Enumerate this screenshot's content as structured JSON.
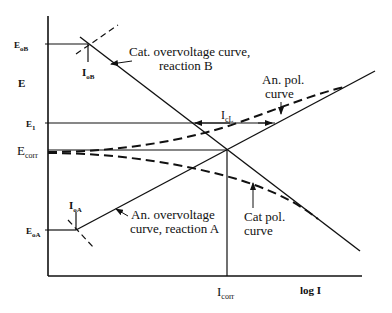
{
  "axes": {
    "y_label": "E",
    "x_label": "log I"
  },
  "potential_labels": {
    "e0b": {
      "main": "E",
      "sub": "oB"
    },
    "e1": {
      "main": "E",
      "sub": "1"
    },
    "ecorr": {
      "main": "E",
      "sub": "corr"
    },
    "e0a": {
      "main": "E",
      "sub": "oA"
    }
  },
  "current_labels": {
    "i0b": {
      "main": "I",
      "sub": "oB"
    },
    "i0a": {
      "main": "I",
      "sub": "oA"
    },
    "icorr": {
      "main": "I",
      "sub": "corr"
    },
    "icl": {
      "main": "I",
      "sub": "cL"
    }
  },
  "annotations": {
    "cat_overvoltage": [
      "Cat. overvoltage curve,",
      "reaction B"
    ],
    "an_overvoltage": [
      "An. overvoltage",
      "curve, reaction A"
    ],
    "an_pol": [
      "An. pol.",
      "curve"
    ],
    "cat_pol": [
      "Cat pol.",
      "curve"
    ]
  },
  "colors": {
    "ink": "#111111",
    "background": "#ffffff"
  }
}
